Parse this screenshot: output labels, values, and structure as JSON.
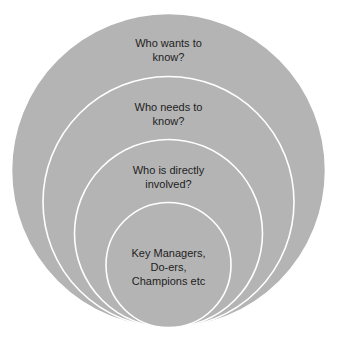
{
  "diagram": {
    "fill_color": "#b4b4b4",
    "stroke_color": "#ffffff",
    "text_color": "#1e1e1e",
    "rings": [
      {
        "name": "outer",
        "cx": 168.5,
        "cy": 170.5,
        "r": 157,
        "lines": [
          "Who wants to",
          "know?"
        ],
        "label_top": 36
      },
      {
        "name": "second",
        "cx": 168.5,
        "cy": 202,
        "r": 125.5,
        "lines": [
          "Who needs to",
          "know?"
        ],
        "label_top": 100
      },
      {
        "name": "third",
        "cx": 168.5,
        "cy": 233.5,
        "r": 94,
        "lines": [
          "Who is directly",
          "involved?"
        ],
        "label_top": 163
      },
      {
        "name": "inner",
        "cx": 168.5,
        "cy": 265,
        "r": 62.5,
        "lines": [
          "Key Managers,",
          "Do-ers,",
          "Champions etc"
        ],
        "label_top": 246
      }
    ]
  }
}
